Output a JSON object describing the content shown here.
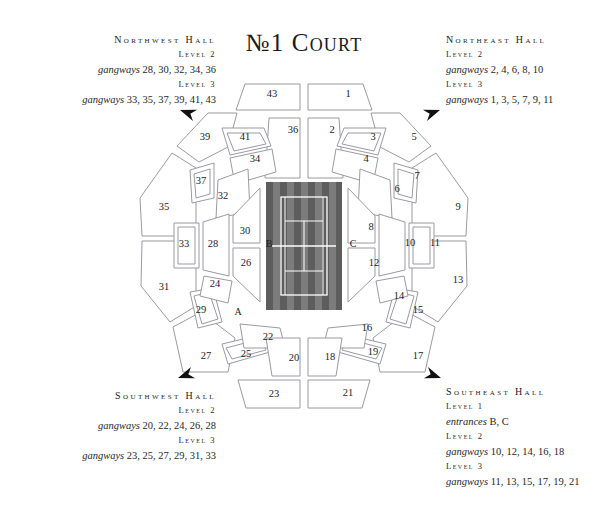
{
  "title": {
    "prefix": "N",
    "ordinal": "o",
    "text": "№1 Court",
    "display": "№1 Court"
  },
  "halls": {
    "northwest": {
      "name": "Northwest Hall",
      "rows": [
        {
          "level": "Level 2",
          "kind": "gangways",
          "list": "28, 30, 32, 34, 36"
        },
        {
          "level": "Level 3",
          "kind": "gangways",
          "list": "33, 35, 37, 39, 41, 43"
        }
      ]
    },
    "northeast": {
      "name": "Northeast Hall",
      "rows": [
        {
          "level": "Level 2",
          "kind": "gangways",
          "list": "2, 4, 6, 8, 10"
        },
        {
          "level": "Level 3",
          "kind": "gangways",
          "list": "1, 3, 5, 7, 9, 11"
        }
      ]
    },
    "southwest": {
      "name": "Southwest Hall",
      "rows": [
        {
          "level": "Level 2",
          "kind": "gangways",
          "list": "20, 22, 24, 26, 28"
        },
        {
          "level": "Level 3",
          "kind": "gangways",
          "list": "23, 25, 27, 29, 31, 33"
        }
      ]
    },
    "southeast": {
      "name": "Southeast Hall",
      "rows": [
        {
          "level": "Level 1",
          "kind": "entrances",
          "list": "B, C"
        },
        {
          "level": "Level 2",
          "kind": "gangways",
          "list": "10, 12, 14, 16, 18"
        },
        {
          "level": "Level 3",
          "kind": "gangways",
          "list": "11, 13, 15, 17, 19, 21"
        }
      ]
    }
  },
  "court": {
    "surface_dark": "#5e5e5e",
    "surface_light": "#7b7b7b",
    "line_color": "#ffffff"
  },
  "colors": {
    "seat_stroke": "#9a9aa2",
    "seat_fill": "#ffffff",
    "text": "#1d1d1d",
    "arrow": "#111111"
  },
  "entrances": [
    {
      "id": "A",
      "label": "A",
      "x": 238,
      "y": 313
    },
    {
      "id": "B",
      "label": "B",
      "x": 269,
      "y": 245
    },
    {
      "id": "C",
      "label": "C",
      "x": 353,
      "y": 245
    }
  ],
  "sections": [
    {
      "label": "1",
      "x": 348,
      "y": 95
    },
    {
      "label": "2",
      "x": 332,
      "y": 131
    },
    {
      "label": "3",
      "x": 373,
      "y": 138
    },
    {
      "label": "4",
      "x": 366,
      "y": 160
    },
    {
      "label": "5",
      "x": 414,
      "y": 138
    },
    {
      "label": "6",
      "x": 397,
      "y": 190
    },
    {
      "label": "7",
      "x": 417,
      "y": 177
    },
    {
      "label": "8",
      "x": 371,
      "y": 228
    },
    {
      "label": "9",
      "x": 458,
      "y": 208
    },
    {
      "label": "10",
      "x": 410,
      "y": 244
    },
    {
      "label": "11",
      "x": 435,
      "y": 244
    },
    {
      "label": "12",
      "x": 374,
      "y": 264
    },
    {
      "label": "13",
      "x": 458,
      "y": 281
    },
    {
      "label": "14",
      "x": 399,
      "y": 297
    },
    {
      "label": "15",
      "x": 418,
      "y": 311
    },
    {
      "label": "16",
      "x": 367,
      "y": 329
    },
    {
      "label": "17",
      "x": 418,
      "y": 357
    },
    {
      "label": "18",
      "x": 330,
      "y": 358
    },
    {
      "label": "19",
      "x": 373,
      "y": 353
    },
    {
      "label": "20",
      "x": 294,
      "y": 359
    },
    {
      "label": "21",
      "x": 348,
      "y": 394
    },
    {
      "label": "22",
      "x": 268,
      "y": 338
    },
    {
      "label": "23",
      "x": 274,
      "y": 395
    },
    {
      "label": "24",
      "x": 215,
      "y": 285
    },
    {
      "label": "25",
      "x": 246,
      "y": 355
    },
    {
      "label": "26",
      "x": 246,
      "y": 264
    },
    {
      "label": "27",
      "x": 206,
      "y": 357
    },
    {
      "label": "28",
      "x": 213,
      "y": 245
    },
    {
      "label": "29",
      "x": 201,
      "y": 311
    },
    {
      "label": "30",
      "x": 245,
      "y": 232
    },
    {
      "label": "31",
      "x": 164,
      "y": 288
    },
    {
      "label": "32",
      "x": 223,
      "y": 197
    },
    {
      "label": "33",
      "x": 184,
      "y": 245
    },
    {
      "label": "34",
      "x": 255,
      "y": 160
    },
    {
      "label": "35",
      "x": 164,
      "y": 208
    },
    {
      "label": "36",
      "x": 293,
      "y": 131
    },
    {
      "label": "37",
      "x": 201,
      "y": 182
    },
    {
      "label": "39",
      "x": 205,
      "y": 138
    },
    {
      "label": "41",
      "x": 245,
      "y": 138
    },
    {
      "label": "43",
      "x": 272,
      "y": 95
    }
  ],
  "arrows": [
    {
      "name": "northwest-arrow",
      "x": 180,
      "y": 110,
      "rot": 200
    },
    {
      "name": "northeast-arrow",
      "x": 440,
      "y": 110,
      "rot": 340
    },
    {
      "name": "southwest-arrow",
      "x": 178,
      "y": 378,
      "rot": 160
    },
    {
      "name": "southeast-arrow",
      "x": 441,
      "y": 378,
      "rot": 20
    }
  ]
}
